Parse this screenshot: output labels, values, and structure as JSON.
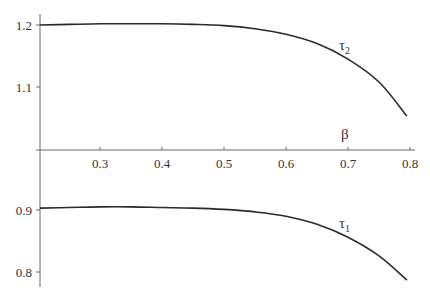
{
  "chart_data": {
    "type": "line",
    "title": "",
    "xlabel": "β",
    "ylabel": "",
    "xlim": [
      0.2,
      0.82
    ],
    "ylim_upper_segment": [
      1.02,
      1.22
    ],
    "ylim_lower_segment": [
      0.78,
      0.92
    ],
    "grid": false,
    "legend": "none (inline curve labels)",
    "x_ticks": [
      0.3,
      0.4,
      0.5,
      0.6,
      0.7,
      0.8
    ],
    "x_tick_labels": [
      "0.3",
      "0.4",
      "0.5",
      "0.6",
      "0.7",
      "0.8"
    ],
    "y_ticks": [
      1.2,
      1.1,
      0.9,
      0.8
    ],
    "y_tick_labels": [
      "1.2",
      "1.1",
      "0.9",
      "0.8"
    ],
    "x": [
      0.2,
      0.25,
      0.3,
      0.35,
      0.4,
      0.45,
      0.5,
      0.55,
      0.6,
      0.65,
      0.7,
      0.75,
      0.8
    ],
    "series": [
      {
        "name": "τ2",
        "label_main": "τ",
        "label_sub": "2",
        "values": [
          1.2,
          1.201,
          1.202,
          1.202,
          1.202,
          1.201,
          1.199,
          1.194,
          1.185,
          1.17,
          1.145,
          1.108,
          1.053
        ]
      },
      {
        "name": "τ1",
        "label_main": "τ",
        "label_sub": "1",
        "values": [
          0.903,
          0.904,
          0.905,
          0.905,
          0.904,
          0.903,
          0.901,
          0.897,
          0.89,
          0.877,
          0.856,
          0.826,
          0.787
        ]
      }
    ],
    "annotations": [
      {
        "text": "τ2",
        "x": 0.7,
        "y": 1.165
      },
      {
        "text": "τ1",
        "x": 0.7,
        "y": 0.874
      },
      {
        "text": "β",
        "x": 0.7,
        "y": 1.02
      }
    ]
  }
}
